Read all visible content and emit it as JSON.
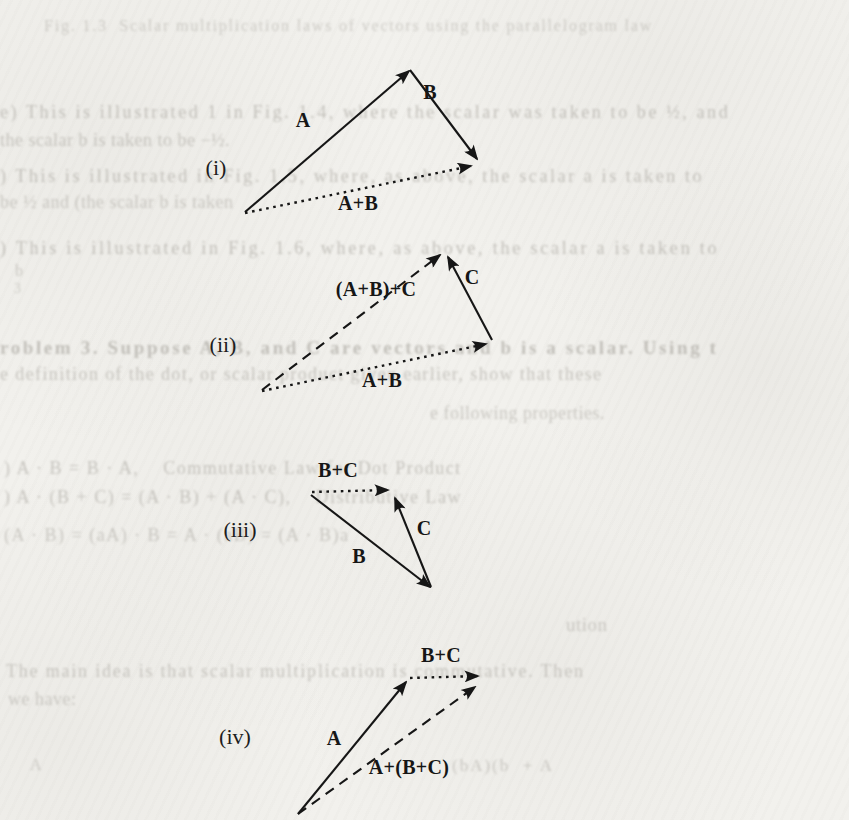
{
  "page": {
    "type": "scanned textbook page — vector addition figure",
    "paper_color": "#f2f1ed",
    "ink_color": "#161616",
    "ghost_ink_color": "#a5a29b"
  },
  "ghost_text": {
    "note": "faint bleed-through / washed-out text visible behind the figure",
    "fragments": [
      {
        "text": "Fig. 1.3  Scalar multiplication laws of vectors using the parallelogram law",
        "x": 44,
        "y": 18,
        "size": 16,
        "ls": 1.8,
        "o": 0.45
      },
      {
        "text": "e) This is illustrated 1 in Fig. 1.4, where the scalar was taken to be ½, and",
        "x": 0,
        "y": 103,
        "size": 18,
        "ls": 2.6,
        "o": 0.6
      },
      {
        "text": "the scalar b is taken to be −½.",
        "x": 0,
        "y": 131,
        "size": 18,
        "ls": 0.5,
        "o": 0.55
      },
      {
        "text": ") This is illustrated in Fig. 1.5, where, as above, the scalar a is taken to",
        "x": 0,
        "y": 167,
        "size": 18,
        "ls": 2.6,
        "o": 0.6
      },
      {
        "text": "be ½ and (the scalar b is taken",
        "x": 0,
        "y": 193,
        "size": 18,
        "ls": 0.5,
        "o": 0.5
      },
      {
        "text": ") This is illustrated in Fig. 1.6, where, as above, the scalar a is taken to",
        "x": 0,
        "y": 239,
        "size": 18,
        "ls": 2.8,
        "o": 0.6
      },
      {
        "text": "b",
        "x": 15,
        "y": 263,
        "size": 16,
        "ls": 0,
        "o": 0.5
      },
      {
        "text": "3",
        "x": 14,
        "y": 282,
        "size": 14,
        "ls": 0,
        "o": 0.45
      },
      {
        "text": "roblem 3. Suppose A, B, and C are vectors and b is a scalar. Using t",
        "x": 0,
        "y": 338,
        "size": 19,
        "ls": 2.6,
        "o": 0.6,
        "bold": true
      },
      {
        "text": "e definition of the dot, or scalar product given earlier, show that these",
        "x": 0,
        "y": 365,
        "size": 18,
        "ls": 1.4,
        "o": 0.55
      },
      {
        "text": "e following properties.",
        "x": 430,
        "y": 404,
        "size": 18,
        "ls": 0.5,
        "o": 0.5
      },
      {
        "text": ") A · B = B · A,    Commutative Law for Dot Product",
        "x": 4,
        "y": 459,
        "size": 18,
        "ls": 1.5,
        "o": 0.55
      },
      {
        "text": ") A · (B + C) = (A · B) + (A · C),    Distributive Law",
        "x": 4,
        "y": 488,
        "size": 18,
        "ls": 1.5,
        "o": 0.55
      },
      {
        "text": "(A · B) = (aA) · B = A · (aB) = (A · B)a",
        "x": 4,
        "y": 526,
        "size": 18,
        "ls": 1.5,
        "o": 0.5
      },
      {
        "text": "ution",
        "x": 566,
        "y": 615,
        "size": 19,
        "ls": 0.5,
        "o": 0.5
      },
      {
        "text": "The main idea is that scalar multiplication is commutative. Then",
        "x": 6,
        "y": 662,
        "size": 18,
        "ls": 1.8,
        "o": 0.55
      },
      {
        "text": "we have:",
        "x": 8,
        "y": 690,
        "size": 18,
        "ls": 0.5,
        "o": 0.5
      },
      {
        "text": "A",
        "x": 30,
        "y": 757,
        "size": 16,
        "ls": 0,
        "o": 0.45
      },
      {
        "text": "(bA)(b  + A",
        "x": 452,
        "y": 757,
        "size": 17,
        "ls": 2,
        "o": 0.5
      }
    ]
  },
  "figure": {
    "diagrams": [
      {
        "id": "i",
        "figure_label": {
          "text": "(i)",
          "x": 216,
          "y": 168
        },
        "lines": [
          {
            "x1": 245,
            "y1": 212,
            "x2": 409,
            "y2": 71,
            "style": "solid",
            "arrow": true
          },
          {
            "x1": 410,
            "y1": 70,
            "x2": 477,
            "y2": 159,
            "style": "solid",
            "arrow": true
          },
          {
            "x1": 245,
            "y1": 213,
            "x2": 471,
            "y2": 166,
            "style": "dot",
            "arrow": true
          }
        ],
        "vector_labels": [
          {
            "text": "A",
            "x": 303,
            "y": 120
          },
          {
            "text": "B",
            "x": 430,
            "y": 92
          },
          {
            "text": "A+B",
            "x": 358,
            "y": 203
          }
        ]
      },
      {
        "id": "ii",
        "figure_label": {
          "text": "(ii)",
          "x": 223,
          "y": 345
        },
        "lines": [
          {
            "x1": 262,
            "y1": 390,
            "x2": 440,
            "y2": 255,
            "style": "dash",
            "arrow": true
          },
          {
            "x1": 262,
            "y1": 391,
            "x2": 486,
            "y2": 344,
            "style": "dot",
            "arrow": true
          },
          {
            "x1": 492,
            "y1": 340,
            "x2": 448,
            "y2": 257,
            "style": "solid",
            "arrow": true
          }
        ],
        "vector_labels": [
          {
            "text": "(A+B)+C",
            "x": 376,
            "y": 289
          },
          {
            "text": "C",
            "x": 472,
            "y": 277
          },
          {
            "text": "A+B",
            "x": 382,
            "y": 380
          }
        ]
      },
      {
        "id": "iii",
        "figure_label": {
          "text": "(iii)",
          "x": 240,
          "y": 530
        },
        "lines": [
          {
            "x1": 312,
            "y1": 492,
            "x2": 388,
            "y2": 490,
            "style": "dot",
            "arrow": true
          },
          {
            "x1": 311,
            "y1": 495,
            "x2": 430,
            "y2": 587,
            "style": "solid",
            "arrow": true
          },
          {
            "x1": 431,
            "y1": 587,
            "x2": 395,
            "y2": 498,
            "style": "solid",
            "arrow": true
          }
        ],
        "vector_labels": [
          {
            "text": "B+C",
            "x": 338,
            "y": 470
          },
          {
            "text": "B",
            "x": 359,
            "y": 556
          },
          {
            "text": "C",
            "x": 424,
            "y": 528
          }
        ]
      },
      {
        "id": "iv",
        "figure_label": {
          "text": "(iv)",
          "x": 235,
          "y": 737
        },
        "lines": [
          {
            "x1": 298,
            "y1": 814,
            "x2": 406,
            "y2": 682,
            "style": "solid",
            "arrow": true
          },
          {
            "x1": 410,
            "y1": 678,
            "x2": 478,
            "y2": 676,
            "style": "dot",
            "arrow": true
          },
          {
            "x1": 298,
            "y1": 814,
            "x2": 475,
            "y2": 687,
            "style": "dash",
            "arrow": true
          }
        ],
        "vector_labels": [
          {
            "text": "B+C",
            "x": 441,
            "y": 655
          },
          {
            "text": "A",
            "x": 334,
            "y": 738
          },
          {
            "text": "A+(B+C)",
            "x": 409,
            "y": 767
          }
        ]
      }
    ]
  }
}
